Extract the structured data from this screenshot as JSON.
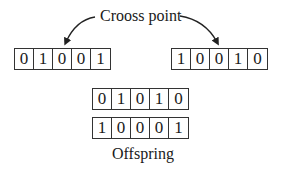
{
  "title_label": "Crooss point",
  "parents": [
    {
      "bits": [
        "0",
        "1",
        "0",
        "0",
        "1"
      ]
    },
    {
      "bits": [
        "1",
        "0",
        "0",
        "1",
        "0"
      ]
    }
  ],
  "offspring": [
    {
      "bits": [
        "0",
        "1",
        "0",
        "1",
        "0"
      ]
    },
    {
      "bits": [
        "1",
        "0",
        "0",
        "0",
        "1"
      ]
    }
  ],
  "offspring_label": "Offspring"
}
